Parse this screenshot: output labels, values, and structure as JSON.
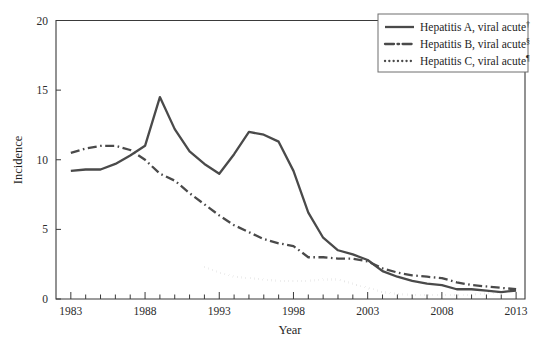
{
  "chart_data": {
    "type": "line",
    "title": "",
    "xlabel": "Year",
    "ylabel": "Incidence",
    "xlim": [
      1982,
      2013.6
    ],
    "ylim": [
      0,
      20
    ],
    "yticks": [
      0,
      5,
      10,
      15,
      20
    ],
    "ytick_labels": [
      "0",
      "5",
      "10",
      "15",
      "20"
    ],
    "xticks_major": [
      1983,
      1988,
      1993,
      1998,
      2003,
      2008,
      2013
    ],
    "xtick_labels": [
      "1983",
      "1988",
      "1993",
      "1998",
      "2003",
      "2008",
      "2013"
    ],
    "xtick_minor_step": 1,
    "grid": false,
    "legend_position": "top-right",
    "series": [
      {
        "name": "Hepatitis A, viral acute",
        "footnote": "†",
        "style": "solid",
        "color": "#4a4a4a",
        "width": 2.3,
        "x": [
          1983,
          1984,
          1985,
          1986,
          1987,
          1988,
          1989,
          1990,
          1991,
          1992,
          1993,
          1994,
          1995,
          1996,
          1997,
          1998,
          1999,
          2000,
          2001,
          2002,
          2003,
          2004,
          2005,
          2006,
          2007,
          2008,
          2009,
          2010,
          2011,
          2012,
          2013
        ],
        "values": [
          9.2,
          9.3,
          9.3,
          9.7,
          10.3,
          11.0,
          14.5,
          12.2,
          10.6,
          9.7,
          9.0,
          10.4,
          12.0,
          11.8,
          11.3,
          9.2,
          6.2,
          4.4,
          3.5,
          3.2,
          2.8,
          2.0,
          1.6,
          1.3,
          1.1,
          1.0,
          0.7,
          0.7,
          0.6,
          0.5,
          0.6
        ]
      },
      {
        "name": "Hepatitis B, viral acute",
        "footnote": "§",
        "style": "dashdot",
        "color": "#4a4a4a",
        "width": 2.3,
        "x": [
          1983,
          1984,
          1985,
          1986,
          1987,
          1988,
          1989,
          1990,
          1991,
          1992,
          1993,
          1994,
          1995,
          1996,
          1997,
          1998,
          1999,
          2000,
          2001,
          2002,
          2003,
          2004,
          2005,
          2006,
          2007,
          2008,
          2009,
          2010,
          2011,
          2012,
          2013
        ],
        "values": [
          10.5,
          10.8,
          11.0,
          11.0,
          10.7,
          10.0,
          9.0,
          8.5,
          7.6,
          6.8,
          6.0,
          5.3,
          4.8,
          4.3,
          4.0,
          3.8,
          3.0,
          3.0,
          2.9,
          2.9,
          2.7,
          2.2,
          1.9,
          1.7,
          1.6,
          1.5,
          1.2,
          1.0,
          0.9,
          0.8,
          0.7
        ]
      },
      {
        "name": "Hepatitis C, viral acute",
        "footnote": "¶",
        "style": "dotted",
        "color": "#4a4a4a",
        "width": 2.3,
        "x": [
          1992,
          1993,
          1994,
          1995,
          1996,
          1997,
          1998,
          1999,
          2000,
          2001,
          2002,
          2003,
          2004,
          2005,
          2006,
          2007,
          2008,
          2009,
          2010,
          2011,
          2012,
          2013
        ],
        "values": [
          2.3,
          1.9,
          1.6,
          1.5,
          1.4,
          1.3,
          1.3,
          1.3,
          1.4,
          1.4,
          1.1,
          0.8,
          0.5,
          0.35,
          0.3,
          0.3,
          0.3,
          0.3,
          0.3,
          0.4,
          0.5,
          0.6
        ]
      }
    ]
  },
  "legend": {
    "entries": [
      {
        "label": "Hepatitis A, viral acute",
        "footnote": "†",
        "style": "solid"
      },
      {
        "label": "Hepatitis B, viral acute",
        "footnote": "§",
        "style": "dashdot"
      },
      {
        "label": "Hepatitis C, viral acute",
        "footnote": "¶",
        "style": "dotted"
      }
    ]
  }
}
